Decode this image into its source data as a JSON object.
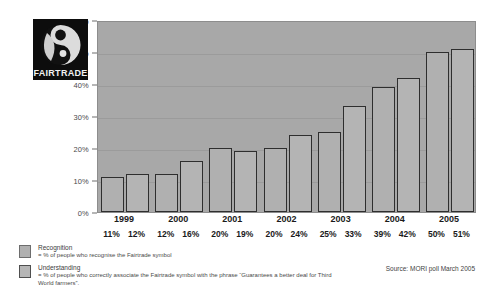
{
  "chart_data": {
    "type": "bar",
    "title": "",
    "xlabel": "",
    "ylabel": "",
    "ylim": [
      0,
      60
    ],
    "grid": true,
    "legend_position": "bottom-left",
    "categories": [
      "1999",
      "2000",
      "2001",
      "2002",
      "2003",
      "2004",
      "2005"
    ],
    "series": [
      {
        "name": "Recognition",
        "values": [
          11,
          12,
          20,
          20,
          25,
          39,
          50
        ]
      },
      {
        "name": "Understanding",
        "values": [
          12,
          16,
          19,
          24,
          33,
          42,
          51
        ]
      }
    ],
    "value_labels": [
      [
        "11%",
        "12%"
      ],
      [
        "12%",
        "16%"
      ],
      [
        "20%",
        "19%"
      ],
      [
        "20%",
        "24%"
      ],
      [
        "25%",
        "33%"
      ],
      [
        "39%",
        "42%"
      ],
      [
        "50%",
        "51%"
      ]
    ],
    "y_ticks": [
      "0%",
      "10%",
      "20%",
      "30%",
      "40%",
      "50%",
      "60%"
    ],
    "y_tick_values": [
      0,
      10,
      20,
      30,
      40,
      50,
      60
    ],
    "annotations": {
      "source": "Source: MORI poll March 2005"
    }
  },
  "logo": {
    "word": "FAIRTRADE",
    "alt": "fairtrade-logo"
  },
  "legend": {
    "items": [
      {
        "title": "Recognition",
        "desc": "= % of people who recognise the Fairtrade symbol"
      },
      {
        "title": "Understanding",
        "desc": "= % of people who correctly associate the Fairtrade symbol with the phrase “Guarantees a better deal for Third World farmers”."
      }
    ]
  },
  "colors": {
    "plot_background": "#a8a8a8",
    "bar_recognition": "#b0b0b0",
    "bar_understanding": "#b4b4b4",
    "bar_outline": "#2e2e2e",
    "gridline": "#9b9b9b"
  }
}
